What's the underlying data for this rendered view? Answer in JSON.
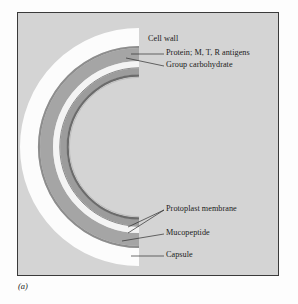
{
  "figure": {
    "caption": "(a)",
    "panel_background": "#d4d4d4",
    "panel_border_color": "#3a3a3a",
    "page_background": "#fdfdfd"
  },
  "diagram": {
    "type": "concentric-cross-section",
    "center_x": 137,
    "center_y": 146,
    "layers": [
      {
        "id": "capsule",
        "label": "Capsule",
        "color": "#fcfcfc",
        "outer_radius": 119,
        "inner_radius": 101,
        "order": 1
      },
      {
        "id": "cell-wall-outline",
        "label": "Cell wall",
        "color": "#8f8f8f",
        "outer_radius": 101,
        "inner_radius": 99,
        "order": 2
      },
      {
        "id": "protein-antigens",
        "label": "Protein; M, T, R antigens",
        "color": "#a3a3a3",
        "outer_radius": 99,
        "inner_radius": 86,
        "order": 3
      },
      {
        "id": "group-carbohydrate",
        "label": "Group carbohydrate",
        "color": "#f2f2f2",
        "outer_radius": 86,
        "inner_radius": 79,
        "order": 4
      },
      {
        "id": "mucopeptide",
        "label": "Mucopeptide",
        "color": "#9a9a9a",
        "outer_radius": 79,
        "inner_radius": 72,
        "order": 5
      },
      {
        "id": "protoplast-membrane",
        "label": "Protoplast membrane",
        "color": "#6e6e6e",
        "outer_radius": 72,
        "inner_radius": 70,
        "order": 6
      }
    ]
  },
  "labels": [
    {
      "id": "cell-wall",
      "text": "Cell wall",
      "x": 156,
      "y": 37,
      "has_leader": false
    },
    {
      "id": "protein-antigens",
      "text": "Protein; M, T, R antigens",
      "x": 166,
      "y": 51,
      "has_leader": true
    },
    {
      "id": "group-carbohydrate",
      "text": "Group carbohydrate",
      "x": 166,
      "y": 63,
      "has_leader": true
    },
    {
      "id": "protoplast-membrane",
      "text": "Protoplast membrane",
      "x": 166,
      "y": 204,
      "has_leader": true
    },
    {
      "id": "mucopeptide",
      "text": "Mucopeptide",
      "x": 166,
      "y": 228,
      "has_leader": true
    },
    {
      "id": "capsule",
      "text": "Capsule",
      "x": 166,
      "y": 250,
      "has_leader": true
    }
  ],
  "leader_line_color": "#2e2e2e"
}
